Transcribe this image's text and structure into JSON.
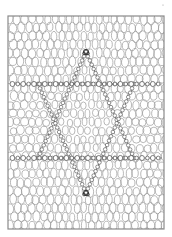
{
  "artwork": {
    "kind": "lace-mesh-hexagram-illustration",
    "description": "Line-art lace/mesh pattern with a six-pointed star formed by two overlapping triangles and two horizontal bead-chain bands",
    "canvas": {
      "width": 172,
      "height": 237,
      "background": "#ffffff"
    },
    "frame": {
      "x": 8,
      "y": 16,
      "width": 156,
      "height": 213,
      "stroke": "#8a8a8a",
      "stroke_width": 1.2
    },
    "mesh": {
      "cell_rx": 3.2,
      "cell_ry": 4.6,
      "col_spacing": 7.4,
      "row_spacing": 8.6,
      "stroke": "#9a9a9a",
      "stroke_width": 0.7,
      "jitter": 0.9
    },
    "bead_bands": [
      {
        "y": 84,
        "x_start": 10,
        "x_end": 162,
        "bead_r": 2.4,
        "spacing": 5.4,
        "stroke": "#555555"
      },
      {
        "y": 158,
        "x_start": 10,
        "x_end": 162,
        "bead_r": 2.4,
        "spacing": 5.4,
        "stroke": "#555555"
      }
    ],
    "hexagram": {
      "up_triangle": [
        [
          86,
          52
        ],
        [
          38,
          158
        ],
        [
          134,
          158
        ]
      ],
      "down_triangle": [
        [
          86,
          193
        ],
        [
          38,
          84
        ],
        [
          134,
          84
        ]
      ],
      "stroke": "#4a4a4a",
      "stroke_width": 0.9,
      "bead_r": 1.8,
      "bead_spacing": 4.6
    },
    "apex_knots": [
      {
        "x": 86,
        "y": 52
      },
      {
        "x": 86,
        "y": 193
      }
    ],
    "speck": {
      "x": 163,
      "y": 5,
      "r": 0.6,
      "color": "#9a9a9a"
    }
  }
}
